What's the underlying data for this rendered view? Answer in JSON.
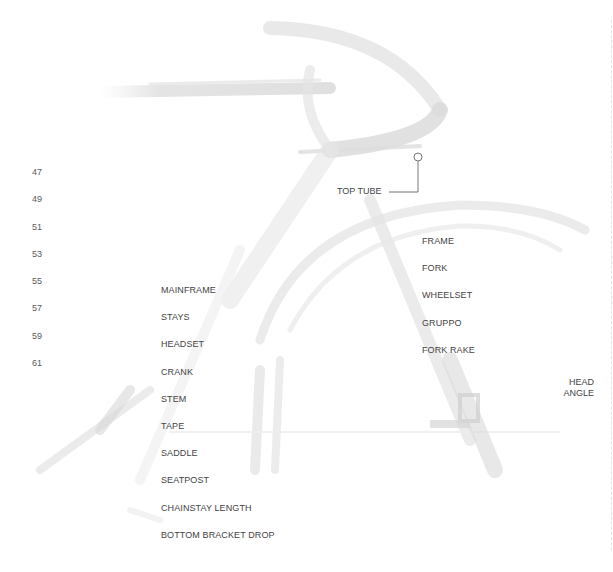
{
  "diagram": {
    "type": "bicycle-geometry-callout",
    "background_color": "#ffffff",
    "ghost_color": "#d9d9d9",
    "text_color": "#444444"
  },
  "sizes": [
    "47",
    "49",
    "51",
    "53",
    "55",
    "57",
    "59",
    "61"
  ],
  "left_labels": [
    "MAINFRAME",
    "STAYS",
    "HEADSET",
    "CRANK",
    "STEM",
    "TAPE",
    "SADDLE",
    "SEATPOST",
    "CHAINSTAY LENGTH",
    "BOTTOM BRACKET DROP"
  ],
  "right_labels": [
    "FRAME",
    "FORK",
    "WHEELSET",
    "GRUPPO",
    "FORK RAKE"
  ],
  "callouts": {
    "top_tube": "TOP TUBE",
    "head_angle_line1": "HEAD",
    "head_angle_line2": "ANGLE"
  }
}
